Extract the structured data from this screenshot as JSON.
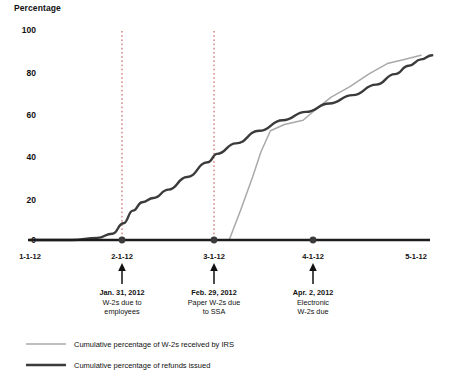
{
  "chart_data": {
    "type": "line",
    "title": "",
    "ylabel": "Percentage",
    "xlabel": "",
    "ylim": [
      0,
      100
    ],
    "grid": false,
    "legend_position": "bottom-left",
    "y_ticks": [
      "0",
      "20",
      "40",
      "60",
      "80",
      "100"
    ],
    "x_ticks": [
      "1-1-12",
      "2-1-12",
      "3-1-12",
      "4-1-12",
      "5-1-12"
    ],
    "x_axis_note": "Dates are month-day-year in 2012; axis spans 1-1-12 through 5-1-12",
    "series": [
      {
        "name": "Cumulative percentage of W-2s received by IRS",
        "color": "#a9a9a9",
        "width": 1.4,
        "points": [
          [
            0.0,
            0
          ],
          [
            1.0,
            0
          ],
          [
            1.6,
            0
          ],
          [
            1.95,
            0
          ],
          [
            2.13,
            0
          ],
          [
            2.25,
            14
          ],
          [
            2.38,
            30
          ],
          [
            2.47,
            42
          ],
          [
            2.57,
            52
          ],
          [
            2.72,
            55
          ],
          [
            2.92,
            57
          ],
          [
            3.05,
            62
          ],
          [
            3.22,
            68
          ],
          [
            3.42,
            73
          ],
          [
            3.62,
            79
          ],
          [
            3.82,
            84
          ],
          [
            4.0,
            86
          ],
          [
            4.18,
            88
          ]
        ]
      },
      {
        "name": "Cumulative percentage of refunds issued",
        "color": "#3b3b3b",
        "width": 2.4,
        "points": [
          [
            0.0,
            0
          ],
          [
            0.45,
            0
          ],
          [
            0.72,
            1
          ],
          [
            0.88,
            3
          ],
          [
            1.0,
            8
          ],
          [
            1.1,
            14
          ],
          [
            1.2,
            18
          ],
          [
            1.32,
            20
          ],
          [
            1.48,
            24
          ],
          [
            1.68,
            30
          ],
          [
            1.9,
            37
          ],
          [
            2.0,
            41
          ],
          [
            2.2,
            46
          ],
          [
            2.45,
            52
          ],
          [
            2.7,
            57
          ],
          [
            2.95,
            61
          ],
          [
            3.2,
            65
          ],
          [
            3.45,
            69
          ],
          [
            3.7,
            74
          ],
          [
            3.9,
            79
          ],
          [
            4.05,
            83
          ],
          [
            4.18,
            86
          ],
          [
            4.3,
            88
          ]
        ]
      }
    ],
    "markers": [
      {
        "x_label": "2-1-12",
        "x": 1.0
      },
      {
        "x_label": "3-1-12",
        "x": 2.0
      },
      {
        "x_label": "4-1-12",
        "x": 3.0
      }
    ],
    "dotted_guides": [
      {
        "x_label": "2-1-12",
        "x": 1.0
      },
      {
        "x_label": "3-1-12",
        "x": 2.0
      }
    ],
    "annotations": [
      {
        "x_label": "2-1-12",
        "title": "Jan. 31, 2012",
        "lines": [
          "W-2s due to",
          "employees"
        ]
      },
      {
        "x_label": "3-1-12",
        "title": "Feb. 29, 2012",
        "lines": [
          "Paper W-2s due",
          "to SSA"
        ]
      },
      {
        "x_label": "4-1-12",
        "title": "Apr. 2, 2012",
        "lines": [
          "Electronic",
          "W-2s due"
        ]
      }
    ]
  },
  "axis": {
    "y_title": "Percentage",
    "y_ticks": {
      "t100": "100",
      "t80": "80",
      "t60": "60",
      "t40": "40",
      "t20": "20",
      "t0": "0"
    },
    "x_ticks": {
      "x1": "1-1-12",
      "x2": "2-1-12",
      "x3": "3-1-12",
      "x4": "4-1-12",
      "x5": "5-1-12"
    }
  },
  "annotations": {
    "a1": {
      "title": "Jan. 31, 2012",
      "line1": "W-2s due to",
      "line2": "employees"
    },
    "a2": {
      "title": "Feb. 29, 2012",
      "line1": "Paper W-2s due",
      "line2": "to SSA"
    },
    "a3": {
      "title": "Apr. 2, 2012",
      "line1": "Electronic",
      "line2": "W-2s due"
    }
  },
  "legend": {
    "items": [
      {
        "label": "Cumulative percentage of W-2s received by IRS",
        "color": "#a9a9a9"
      },
      {
        "label": "Cumulative percentage of refunds issued",
        "color": "#3b3b3b"
      }
    ],
    "item1_label": "Cumulative percentage of W-2s received by IRS",
    "item2_label": "Cumulative percentage of refunds issued"
  },
  "colors": {
    "light_series": "#a9a9a9",
    "dark_series": "#3b3b3b",
    "axis": "#1c1c1c",
    "guide": "#b03a2e",
    "text": "#111111"
  }
}
